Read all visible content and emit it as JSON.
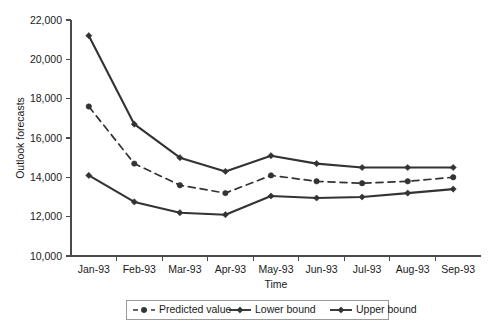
{
  "chart_data": {
    "type": "line",
    "title": "",
    "xlabel": "Time",
    "ylabel": "Outlook forecasts",
    "categories": [
      "Jan-93",
      "Feb-93",
      "Mar-93",
      "Apr-93",
      "May-93",
      "Jun-93",
      "Jul-93",
      "Aug-93",
      "Sep-93"
    ],
    "ylim": [
      10000,
      22000
    ],
    "yticks": [
      10000,
      12000,
      14000,
      16000,
      18000,
      20000,
      22000
    ],
    "ytick_labels": [
      "10,000",
      "12,000",
      "14,000",
      "16,000",
      "18,000",
      "20,000",
      "22,000"
    ],
    "grid": false,
    "legend_position": "bottom",
    "series": [
      {
        "name": "Predicted value",
        "style": "dashed",
        "marker": "circle",
        "color": "#333333",
        "values": [
          17600,
          14700,
          13600,
          13200,
          14100,
          13800,
          13700,
          13800,
          14000
        ]
      },
      {
        "name": "Lower bound",
        "style": "solid",
        "marker": "diamond",
        "color": "#333333",
        "values": [
          14100,
          12750,
          12200,
          12100,
          13050,
          12950,
          13000,
          13200,
          13400
        ]
      },
      {
        "name": "Upper bound",
        "style": "solid",
        "marker": "diamond",
        "color": "#333333",
        "values": [
          21200,
          16700,
          15000,
          14300,
          15100,
          14700,
          14500,
          14500,
          14500
        ]
      }
    ]
  },
  "legend": {
    "entries": [
      {
        "label": "Predicted value"
      },
      {
        "label": "Lower bound"
      },
      {
        "label": "Upper bound"
      }
    ]
  },
  "axes": {
    "y_title": "Outlook forecasts",
    "x_title": "Time"
  }
}
